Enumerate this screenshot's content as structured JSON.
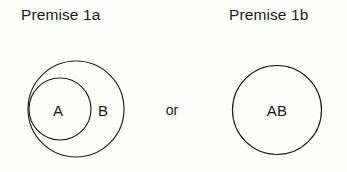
{
  "figure": {
    "type": "euler-diagram",
    "background_color": "#fdfdfc",
    "stroke_color": "#1d1d1d"
  },
  "panels": [
    {
      "id": "premise-1a",
      "title": "Premise 1a",
      "description": "Set A drawn as a smaller circle nested inside and internally tangent to the larger circle B",
      "circles": [
        {
          "label": "B",
          "cx": 76,
          "cy": 109,
          "r": 48,
          "role": "outer"
        },
        {
          "label": "A",
          "cx": 60,
          "cy": 109,
          "r": 31,
          "role": "inner"
        }
      ],
      "labels": [
        {
          "text": "A",
          "x": 58,
          "y": 110
        },
        {
          "text": "B",
          "x": 103,
          "y": 110
        }
      ]
    },
    {
      "id": "premise-1b",
      "title": "Premise 1b",
      "description": "A single circle labelled AB, where the two sets coincide",
      "circles": [
        {
          "label": "AB",
          "cx": 277,
          "cy": 110,
          "r": 44.5,
          "role": "single"
        }
      ],
      "labels": [
        {
          "text": "AB",
          "x": 277,
          "y": 110
        }
      ]
    }
  ],
  "connector": {
    "text": "or",
    "x": 172,
    "y": 110
  }
}
